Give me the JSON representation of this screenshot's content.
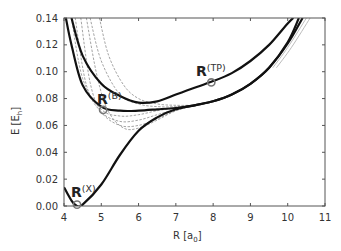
{
  "chart_data": {
    "type": "line",
    "title": "",
    "xlabel": "R [a0]",
    "xlabel_main": "R [a",
    "xlabel_sub": "0",
    "xlabel_end": "]",
    "ylabel": "E [Eh]",
    "ylabel_main": "E [E",
    "ylabel_sub": "h",
    "ylabel_end": "]",
    "xlim": [
      4,
      11
    ],
    "ylim": [
      0.0,
      0.14
    ],
    "xticks": [
      "4",
      "5",
      "6",
      "7",
      "8",
      "9",
      "10",
      "11"
    ],
    "yticks": [
      "0.00",
      "0.02",
      "0.04",
      "0.06",
      "0.08",
      "0.10",
      "0.12",
      "0.14"
    ],
    "grid": false,
    "legend": null,
    "series": [
      {
        "name": "X-state curve",
        "style": "solid-black-thick",
        "x": [
          4.0,
          4.2,
          4.35,
          4.5,
          5.0,
          5.5,
          6.0,
          6.5,
          7.0,
          7.5,
          8.0,
          8.5,
          9.0,
          9.5,
          10.0,
          10.3
        ],
        "y": [
          0.014,
          0.004,
          0.0,
          0.001,
          0.016,
          0.038,
          0.056,
          0.066,
          0.072,
          0.075,
          0.078,
          0.083,
          0.091,
          0.103,
          0.122,
          0.14
        ]
      },
      {
        "name": "B-state curve",
        "style": "solid-black-thick",
        "x": [
          4.05,
          4.2,
          4.5,
          5.0,
          5.5,
          6.0,
          6.5,
          7.0,
          7.5,
          8.0,
          8.5,
          9.0,
          9.5,
          10.0,
          10.4
        ],
        "y": [
          0.14,
          0.12,
          0.09,
          0.074,
          0.071,
          0.071,
          0.072,
          0.073,
          0.075,
          0.078,
          0.083,
          0.091,
          0.103,
          0.121,
          0.14
        ]
      },
      {
        "name": "TP curve",
        "style": "solid-black-thick",
        "x": [
          4.2,
          4.5,
          5.0,
          5.5,
          6.0,
          6.5,
          7.0,
          7.5,
          8.0,
          8.5,
          9.0,
          9.5,
          10.0,
          10.15
        ],
        "y": [
          0.14,
          0.112,
          0.091,
          0.082,
          0.077,
          0.078,
          0.083,
          0.088,
          0.093,
          0.099,
          0.108,
          0.12,
          0.136,
          0.14
        ]
      },
      {
        "name": "dashed 1",
        "style": "dashed-gray",
        "x": [
          4.7,
          5.0,
          5.5,
          6.0,
          6.5,
          7.0,
          7.5
        ],
        "y": [
          0.14,
          0.108,
          0.083,
          0.076,
          0.074,
          0.074,
          0.075
        ]
      },
      {
        "name": "dashed 2",
        "style": "dashed-gray",
        "x": [
          4.95,
          5.2,
          5.6,
          6.0,
          6.5,
          7.0,
          7.5
        ],
        "y": [
          0.14,
          0.112,
          0.09,
          0.08,
          0.076,
          0.075,
          0.075
        ]
      },
      {
        "name": "dashed 3",
        "style": "dashed-gray",
        "x": [
          4.2,
          4.5,
          5.0,
          5.5,
          6.0,
          6.5,
          7.0,
          7.5
        ],
        "y": [
          0.14,
          0.095,
          0.072,
          0.067,
          0.068,
          0.071,
          0.073,
          0.075
        ]
      },
      {
        "name": "dashed 4",
        "style": "dashed-gray",
        "x": [
          4.3,
          4.6,
          5.0,
          5.5,
          6.0,
          6.5,
          7.0,
          7.5
        ],
        "y": [
          0.14,
          0.09,
          0.07,
          0.063,
          0.064,
          0.068,
          0.072,
          0.075
        ]
      },
      {
        "name": "dashed 5",
        "style": "dashed-gray",
        "x": [
          4.45,
          4.7,
          5.0,
          5.5,
          6.0,
          6.5,
          7.0,
          7.5
        ],
        "y": [
          0.14,
          0.092,
          0.07,
          0.06,
          0.06,
          0.065,
          0.071,
          0.075
        ]
      },
      {
        "name": "dashed 6",
        "style": "dashed-gray",
        "x": [
          4.6,
          4.9,
          5.2,
          5.6,
          6.0,
          6.5,
          7.0,
          7.5
        ],
        "y": [
          0.14,
          0.095,
          0.07,
          0.058,
          0.058,
          0.064,
          0.071,
          0.075
        ]
      },
      {
        "name": "gray right 1",
        "style": "solid-gray-thin",
        "x": [
          9.6,
          10.0,
          10.5
        ],
        "y": [
          0.103,
          0.118,
          0.14
        ]
      },
      {
        "name": "gray right 2",
        "style": "solid-gray-thin",
        "x": [
          9.7,
          10.1,
          10.6
        ],
        "y": [
          0.103,
          0.118,
          0.14
        ]
      }
    ],
    "annotations": [
      {
        "label": "R",
        "sup": "(X)",
        "marker_x": 4.35,
        "marker_y": 0.001
      },
      {
        "label": "R",
        "sup": "(B)",
        "marker_x": 5.05,
        "marker_y": 0.0715
      },
      {
        "label": "R",
        "sup": "(TP)",
        "marker_x": 7.95,
        "marker_y": 0.092
      }
    ]
  },
  "colors": {
    "solid": "#111111",
    "dashed": "#9a9a9a",
    "axis": "#555555",
    "marker": "#777777"
  }
}
